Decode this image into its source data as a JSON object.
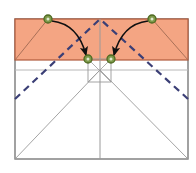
{
  "figure": {
    "type": "geometric-fold-diagram",
    "canvas": {
      "width": 196,
      "height": 173,
      "background": "#ffffff"
    },
    "colors": {
      "shaded_region_fill": "#f4a583",
      "shaded_region_stroke": "#b05a3c",
      "crease_dashed": "#3b3f76",
      "construction_line": "#9a9a9a",
      "outline": "#7a7a7a",
      "marker_fill": "#7d9a4a",
      "marker_ring": "#4f6a22",
      "arrow": "#101010"
    },
    "paper_outline": {
      "label": "square-sheet-outline",
      "left": 15,
      "top": 19,
      "right": 188,
      "bottom": 159
    },
    "shaded_region": {
      "label": "folded-flap-band",
      "left": 15,
      "top": 19,
      "right": 188,
      "bottom": 60,
      "fill": "#f4a583"
    },
    "horizontal_lines": [
      {
        "name": "flap-edge-line",
        "y": 60,
        "x1": 15,
        "x2": 188,
        "color": "#7a7a7a"
      },
      {
        "name": "construction-horizontal",
        "y": 70,
        "x1": 15,
        "x2": 188,
        "color": "#b8b8b8"
      }
    ],
    "vertical_lines": [
      {
        "name": "center-vertical-axis",
        "x": 100,
        "y1": 19,
        "y2": 159,
        "color": "#9a9a9a"
      }
    ],
    "dashed_creases": [
      {
        "name": "crease-left-diagonal",
        "x1": 15,
        "y1": 99,
        "x2": 100,
        "y2": 19
      },
      {
        "name": "crease-right-diagonal",
        "x1": 188,
        "y1": 99,
        "x2": 100,
        "y2": 19
      }
    ],
    "construction_lines": [
      {
        "name": "fold-line-left-upper",
        "x1": 15,
        "y1": 60,
        "x2": 48,
        "y2": 19
      },
      {
        "name": "fold-line-right-upper",
        "x1": 188,
        "y1": 60,
        "x2": 152,
        "y2": 19
      },
      {
        "name": "valley-left-lower",
        "x1": 15,
        "y1": 159,
        "x2": 100,
        "y2": 70
      },
      {
        "name": "valley-right-lower",
        "x1": 188,
        "y1": 159,
        "x2": 100,
        "y2": 70
      },
      {
        "name": "box-diagonal-left",
        "x1": 88,
        "y1": 59,
        "x2": 111,
        "y2": 82
      },
      {
        "name": "box-diagonal-right",
        "x1": 111,
        "y1": 59,
        "x2": 88,
        "y2": 82
      }
    ],
    "small_square": {
      "name": "center-reference-square",
      "left": 88,
      "top": 59,
      "right": 111,
      "bottom": 82
    },
    "markers": [
      {
        "name": "marker-source-left",
        "cx": 48,
        "cy": 19,
        "r": 4,
        "role": "source point"
      },
      {
        "name": "marker-source-right",
        "cx": 152,
        "cy": 19,
        "r": 4,
        "role": "source point"
      },
      {
        "name": "marker-target-left",
        "cx": 88,
        "cy": 59,
        "r": 4,
        "role": "target point"
      },
      {
        "name": "marker-target-right",
        "cx": 111,
        "cy": 59,
        "r": 4,
        "role": "target point"
      }
    ],
    "arrows": [
      {
        "name": "fold-arrow-left",
        "from": {
          "x": 52,
          "y": 21
        },
        "to": {
          "x": 86,
          "y": 55
        },
        "control": {
          "x": 78,
          "y": 24
        },
        "direction": "left-source to left-target"
      },
      {
        "name": "fold-arrow-right",
        "from": {
          "x": 148,
          "y": 21
        },
        "to": {
          "x": 114,
          "y": 55
        },
        "control": {
          "x": 122,
          "y": 24
        },
        "direction": "right-source to right-target"
      }
    ]
  }
}
